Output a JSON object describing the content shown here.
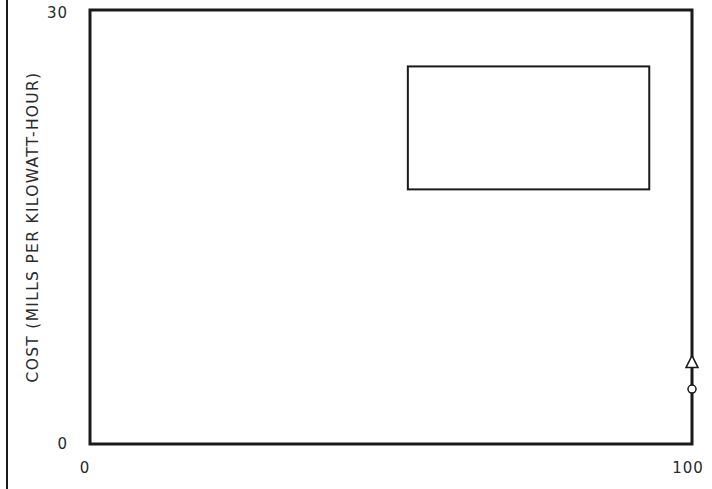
{
  "chart_data": {
    "type": "scatter",
    "title": "",
    "xlabel": "",
    "ylabel": "COST (MILLS PER KILOWATT-HOUR)",
    "xlim": [
      0,
      100
    ],
    "ylim": [
      0,
      30
    ],
    "grid": false,
    "x_ticks": [
      {
        "value": 0,
        "label": "0"
      },
      {
        "value": 100,
        "label": "100"
      }
    ],
    "y_ticks": [
      {
        "value": 0,
        "label": "0"
      },
      {
        "value": 30,
        "label": "30"
      }
    ],
    "regions": [
      {
        "name": "cost-range-box",
        "x": [
          52.8,
          92.9
        ],
        "y": [
          17.6,
          26.1
        ]
      }
    ],
    "markers": [
      {
        "name": "triangle-marker",
        "shape": "triangle",
        "x": 100,
        "y": 5.7
      },
      {
        "name": "circle-marker",
        "shape": "circle",
        "x": 100,
        "y": 3.8
      }
    ],
    "marker_segment": {
      "x": 100,
      "y": [
        0,
        5.7
      ]
    },
    "colors": {
      "ink": "#1a1a1a",
      "background": "#ffffff"
    }
  }
}
